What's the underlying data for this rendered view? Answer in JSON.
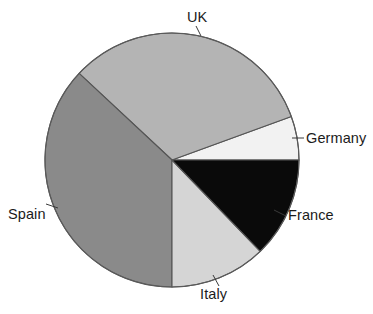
{
  "chart_data": {
    "type": "pie",
    "title": "",
    "subtitle": "",
    "xlabel": "",
    "ylabel": "",
    "legend_position": "none",
    "grid": false,
    "labels_position": "outside-with-leader-lines",
    "center": {
      "x": 172,
      "y": 160
    },
    "radius": 127,
    "start_angle_deg": 0,
    "direction": "counterclockwise",
    "categories": [
      "Germany",
      "UK",
      "Spain",
      "Italy",
      "France"
    ],
    "values": [
      5.5,
      32.5,
      37.0,
      12.2,
      12.8
    ],
    "colors": [
      "#f2f2f2",
      "#b4b4b4",
      "#8a8a8a",
      "#d5d5d5",
      "#0a0a0a"
    ],
    "slices": [
      {
        "name": "Germany",
        "label": "Germany",
        "value": 5.5,
        "color": "#f2f2f2",
        "start_angle_deg": 0,
        "end_angle_deg": 20,
        "leader_from": {
          "x": 292,
          "y": 138
        },
        "leader_to": {
          "x": 304,
          "y": 138
        },
        "label_pos": {
          "x": 306,
          "y": 131
        }
      },
      {
        "name": "UK",
        "label": "UK",
        "value": 32.5,
        "color": "#b4b4b4",
        "start_angle_deg": 20,
        "end_angle_deg": 137,
        "leader_from": {
          "x": 201,
          "y": 36
        },
        "leader_to": {
          "x": 196,
          "y": 26
        },
        "label_pos": {
          "x": 187,
          "y": 10
        }
      },
      {
        "name": "Spain",
        "label": "Spain",
        "value": 37.0,
        "color": "#8a8a8a",
        "start_angle_deg": 137,
        "end_angle_deg": 270,
        "leader_from": {
          "x": 58,
          "y": 208
        },
        "leader_to": {
          "x": 46,
          "y": 204
        },
        "label_pos": {
          "x": 8,
          "y": 207
        }
      },
      {
        "name": "Italy",
        "label": "Italy",
        "value": 12.2,
        "color": "#d5d5d5",
        "start_angle_deg": 270,
        "end_angle_deg": 314,
        "leader_from": {
          "x": 213,
          "y": 275
        },
        "leader_to": {
          "x": 219,
          "y": 286
        },
        "label_pos": {
          "x": 200,
          "y": 287
        }
      },
      {
        "name": "France",
        "label": "France",
        "value": 12.8,
        "color": "#0a0a0a",
        "start_angle_deg": 314,
        "end_angle_deg": 360,
        "leader_from": {
          "x": 274,
          "y": 210
        },
        "leader_to": {
          "x": 286,
          "y": 216
        },
        "label_pos": {
          "x": 288,
          "y": 208
        }
      }
    ],
    "outline_color": "#555555",
    "background_color": "#ffffff"
  }
}
